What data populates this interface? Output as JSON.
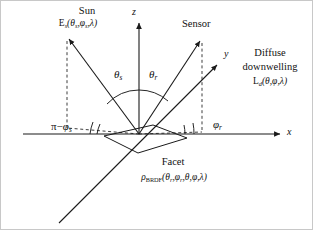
{
  "figure": {
    "kind": "geometry-diagram",
    "title_visible": false,
    "background_color": "#ffffff",
    "line_color": "#1a1a1a",
    "border_color": "#c8c8c8",
    "width": 313,
    "height": 230
  },
  "axes": {
    "z": {
      "label": "z",
      "direction": "up",
      "arrow": true
    },
    "x": {
      "label": "x",
      "direction": "right",
      "arrow": true
    },
    "y": {
      "label": "y",
      "direction": "up-right",
      "arrow": true
    }
  },
  "labels": {
    "sun_title": "Sun",
    "sun_symbol": "E",
    "sun_symbol_sub": "s",
    "sun_args": "(θ",
    "sun_formula_plain": "Es(θs,φs,λ)",
    "sensor_title": "Sensor",
    "diffuse_line1": "Diffuse",
    "diffuse_line2": "downwelling",
    "diffuse_formula_plain": "Ld(θ,φ,λ)",
    "facet_title": "Facet",
    "facet_formula_plain": "ρBRDF(θr,φr,θ,φ,λ)",
    "theta_s_plain": "θs",
    "theta_r_plain": "θr",
    "phi_s_plain": "π−φs",
    "phi_r_plain": "φr"
  },
  "symbols": {
    "rho": "ρ",
    "theta": "θ",
    "phi": "φ",
    "lambda": "λ",
    "pi": "π",
    "minus": "−",
    "E": "E",
    "L": "L",
    "sub_s": "s",
    "sub_r": "r",
    "sub_d": "d",
    "sub_brdf": "BRDF",
    "paren_open": "(",
    "paren_close": ")",
    "comma": ","
  },
  "geometry": {
    "origin": {
      "x": 138,
      "y": 133
    },
    "sun_ray_tip": {
      "x": 66,
      "y": 36
    },
    "sensor_ray_tip": {
      "x": 201,
      "y": 38
    },
    "y_axis_tip": {
      "x": 219,
      "y": 62
    },
    "y_axis_tail": {
      "x": 58,
      "y": 222
    },
    "z_axis_tip": {
      "x": 138,
      "y": 20
    },
    "x_axis_tip": {
      "x": 281,
      "y": 133
    },
    "x_axis_tail": {
      "x": 22,
      "y": 133
    },
    "facet_corners": [
      {
        "x": 103,
        "y": 135
      },
      {
        "x": 152,
        "y": 124
      },
      {
        "x": 186,
        "y": 137
      },
      {
        "x": 137,
        "y": 152
      }
    ],
    "angle_arc_theta_s_deg": 36,
    "angle_arc_theta_r_deg": 32
  }
}
